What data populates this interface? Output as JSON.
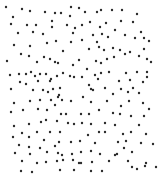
{
  "canvas": {
    "width": 159,
    "height": 183,
    "background": "#ffffff"
  },
  "dot_style": {
    "color": "#2b2b2b",
    "radius": 1.2
  },
  "dots": [
    [
      6,
      7
    ],
    [
      22,
      9
    ],
    [
      30,
      11
    ],
    [
      45,
      12
    ],
    [
      55,
      13
    ],
    [
      61,
      13
    ],
    [
      71,
      7
    ],
    [
      79,
      8
    ],
    [
      85,
      12
    ],
    [
      97,
      12
    ],
    [
      101,
      10
    ],
    [
      112,
      10
    ],
    [
      122,
      10
    ],
    [
      137,
      14
    ],
    [
      13,
      17
    ],
    [
      70,
      16
    ],
    [
      11,
      24
    ],
    [
      27,
      25
    ],
    [
      36,
      25
    ],
    [
      52,
      21
    ],
    [
      52,
      27
    ],
    [
      67,
      25
    ],
    [
      75,
      28
    ],
    [
      82,
      25
    ],
    [
      90,
      22
    ],
    [
      100,
      27
    ],
    [
      106,
      23
    ],
    [
      121,
      21
    ],
    [
      133,
      22
    ],
    [
      115,
      30
    ],
    [
      18,
      33
    ],
    [
      33,
      32
    ],
    [
      43,
      34
    ],
    [
      73,
      33
    ],
    [
      82,
      40
    ],
    [
      93,
      35
    ],
    [
      102,
      34
    ],
    [
      108,
      37
    ],
    [
      125,
      35
    ],
    [
      141,
      32
    ],
    [
      144,
      38
    ],
    [
      135,
      38
    ],
    [
      14,
      45
    ],
    [
      30,
      46
    ],
    [
      47,
      43
    ],
    [
      56,
      41
    ],
    [
      71,
      42
    ],
    [
      97,
      42
    ],
    [
      149,
      41
    ],
    [
      89,
      49
    ],
    [
      99,
      47
    ],
    [
      104,
      50
    ],
    [
      113,
      48
    ],
    [
      120,
      50
    ],
    [
      130,
      52
    ],
    [
      144,
      49
    ],
    [
      21,
      54
    ],
    [
      29,
      56
    ],
    [
      44,
      57
    ],
    [
      50,
      59
    ],
    [
      63,
      51
    ],
    [
      125,
      54
    ],
    [
      139,
      56
    ],
    [
      147,
      59
    ],
    [
      114,
      57
    ],
    [
      7,
      61
    ],
    [
      37,
      62
    ],
    [
      55,
      62
    ],
    [
      58,
      63
    ],
    [
      73,
      65
    ],
    [
      79,
      60
    ],
    [
      96,
      61
    ],
    [
      101,
      63
    ],
    [
      107,
      59
    ],
    [
      151,
      62
    ],
    [
      87,
      69
    ],
    [
      101,
      73
    ],
    [
      95,
      75
    ],
    [
      109,
      72
    ],
    [
      126,
      73
    ],
    [
      137,
      72
    ],
    [
      147,
      72
    ],
    [
      10,
      75
    ],
    [
      19,
      74
    ],
    [
      26,
      74
    ],
    [
      31,
      72
    ],
    [
      35,
      76
    ],
    [
      40,
      74
    ],
    [
      46,
      74
    ],
    [
      51,
      79
    ],
    [
      57,
      76
    ],
    [
      63,
      73
    ],
    [
      70,
      76
    ],
    [
      74,
      77
    ],
    [
      82,
      77
    ],
    [
      98,
      79
    ],
    [
      147,
      77
    ],
    [
      20,
      82
    ],
    [
      26,
      84
    ],
    [
      38,
      81
    ],
    [
      50,
      81
    ],
    [
      119,
      81
    ],
    [
      130,
      80
    ],
    [
      143,
      82
    ],
    [
      89,
      85
    ],
    [
      11,
      89
    ],
    [
      33,
      90
    ],
    [
      43,
      90
    ],
    [
      53,
      89
    ],
    [
      60,
      88
    ],
    [
      91,
      89
    ],
    [
      93,
      90
    ],
    [
      105,
      88
    ],
    [
      121,
      89
    ],
    [
      133,
      88
    ],
    [
      48,
      92
    ],
    [
      59,
      95
    ],
    [
      83,
      97
    ],
    [
      113,
      94
    ],
    [
      128,
      92
    ],
    [
      139,
      93
    ],
    [
      14,
      103
    ],
    [
      30,
      101
    ],
    [
      40,
      100
    ],
    [
      51,
      100
    ],
    [
      58,
      97
    ],
    [
      62,
      100
    ],
    [
      71,
      101
    ],
    [
      91,
      102
    ],
    [
      107,
      101
    ],
    [
      121,
      106
    ],
    [
      129,
      101
    ],
    [
      143,
      103
    ],
    [
      149,
      109
    ],
    [
      11,
      112
    ],
    [
      23,
      110
    ],
    [
      38,
      109
    ],
    [
      47,
      110
    ],
    [
      55,
      105
    ],
    [
      61,
      114
    ],
    [
      66,
      114
    ],
    [
      81,
      114
    ],
    [
      89,
      114
    ],
    [
      99,
      110
    ],
    [
      113,
      113
    ],
    [
      120,
      114
    ],
    [
      131,
      116
    ],
    [
      144,
      116
    ],
    [
      14,
      126
    ],
    [
      29,
      124
    ],
    [
      41,
      122
    ],
    [
      46,
      120
    ],
    [
      57,
      121
    ],
    [
      68,
      123
    ],
    [
      74,
      124
    ],
    [
      82,
      123
    ],
    [
      91,
      124
    ],
    [
      105,
      123
    ],
    [
      115,
      125
    ],
    [
      139,
      125
    ],
    [
      13,
      137
    ],
    [
      22,
      133
    ],
    [
      29,
      137
    ],
    [
      37,
      132
    ],
    [
      50,
      132
    ],
    [
      60,
      132
    ],
    [
      88,
      135
    ],
    [
      99,
      132
    ],
    [
      105,
      132
    ],
    [
      123,
      134
    ],
    [
      131,
      132
    ],
    [
      146,
      134
    ],
    [
      44,
      140
    ],
    [
      19,
      145
    ],
    [
      29,
      147
    ],
    [
      40,
      148
    ],
    [
      55,
      146
    ],
    [
      59,
      142
    ],
    [
      71,
      142
    ],
    [
      80,
      141
    ],
    [
      95,
      143
    ],
    [
      118,
      142
    ],
    [
      126,
      141
    ],
    [
      141,
      143
    ],
    [
      153,
      144
    ],
    [
      124,
      148
    ],
    [
      15,
      153
    ],
    [
      30,
      154
    ],
    [
      47,
      152
    ],
    [
      58,
      153
    ],
    [
      62,
      155
    ],
    [
      72,
      154
    ],
    [
      81,
      152
    ],
    [
      91,
      151
    ],
    [
      100,
      154
    ],
    [
      115,
      155
    ],
    [
      132,
      152
    ],
    [
      117,
      154
    ],
    [
      22,
      161
    ],
    [
      37,
      163
    ],
    [
      46,
      162
    ],
    [
      57,
      161
    ],
    [
      63,
      160
    ],
    [
      73,
      160
    ],
    [
      79,
      163
    ],
    [
      81,
      163
    ],
    [
      92,
      162
    ],
    [
      109,
      161
    ],
    [
      128,
      161
    ],
    [
      146,
      163
    ],
    [
      132,
      167
    ],
    [
      145,
      166
    ],
    [
      156,
      167
    ],
    [
      137,
      169
    ],
    [
      21,
      171
    ],
    [
      32,
      172
    ],
    [
      60,
      170
    ],
    [
      74,
      170
    ],
    [
      91,
      171
    ],
    [
      102,
      171
    ]
  ]
}
